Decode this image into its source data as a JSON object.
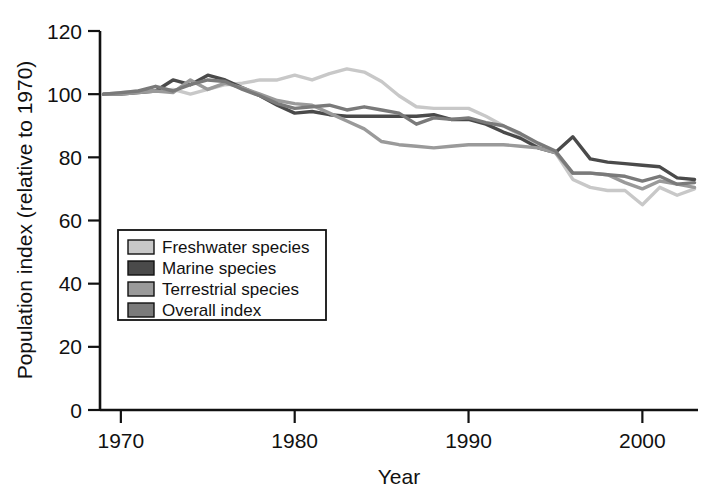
{
  "chart_data": {
    "type": "line",
    "title": "",
    "xlabel": "Year",
    "ylabel": "Population index (relative to 1970)",
    "xlim": [
      1968.8,
      2003.2
    ],
    "ylim": [
      0,
      120
    ],
    "xticks": [
      1970,
      1980,
      1990,
      2000
    ],
    "yticks": [
      0,
      20,
      40,
      60,
      80,
      100,
      120
    ],
    "grid": false,
    "legend_position": "inside-lower-left",
    "x": [
      1969,
      1970,
      1971,
      1972,
      1973,
      1974,
      1975,
      1976,
      1977,
      1978,
      1979,
      1980,
      1981,
      1982,
      1983,
      1984,
      1985,
      1986,
      1987,
      1988,
      1989,
      1990,
      1991,
      1992,
      1993,
      1994,
      1995,
      1996,
      1997,
      1998,
      1999,
      2000,
      2001,
      2002,
      2003
    ],
    "series": [
      {
        "name": "Freshwater species",
        "color": "#c8c8c8",
        "values": [
          100,
          100.5,
          101,
          101,
          101.5,
          100,
          101.5,
          103,
          103.5,
          104.5,
          104.5,
          106,
          104.5,
          106.5,
          108,
          107,
          104,
          99.5,
          96,
          95.5,
          95.5,
          95.5,
          93,
          90,
          87,
          84,
          81.5,
          73,
          70.5,
          69.5,
          69.5,
          65,
          70.5,
          68,
          70
        ]
      },
      {
        "name": "Marine species",
        "color": "#4a4a4a",
        "values": [
          100,
          100,
          100.5,
          101,
          104.5,
          103,
          106,
          104.5,
          102,
          99.5,
          96.5,
          94,
          94.5,
          93.5,
          93,
          93,
          93,
          93,
          93,
          93.5,
          92,
          92,
          90.5,
          88,
          86,
          83,
          81.5,
          86.5,
          79.5,
          78.5,
          78,
          77.5,
          77,
          73.5,
          73
        ]
      },
      {
        "name": "Terrestrial species",
        "color": "#9a9a9a",
        "values": [
          100,
          100,
          100.5,
          101,
          100.5,
          104.5,
          101.5,
          103.5,
          102,
          100,
          98,
          97,
          96.5,
          94,
          91.5,
          89,
          85,
          84,
          83.5,
          83,
          83.5,
          84,
          84,
          84,
          83.5,
          83,
          81.5,
          75,
          75,
          74.5,
          72,
          70,
          72.5,
          71.5,
          70.5
        ]
      },
      {
        "name": "Overall index",
        "color": "#7a7a7a",
        "values": [
          100,
          100.5,
          101,
          102.5,
          101,
          103,
          104.5,
          104,
          101.5,
          99.5,
          97,
          95.5,
          96,
          96.5,
          95,
          96,
          95,
          94,
          90.5,
          92.5,
          92,
          92.5,
          91,
          90,
          87.5,
          84.5,
          82,
          75,
          75,
          74.5,
          74,
          72.5,
          74,
          71.5,
          72
        ]
      }
    ]
  },
  "legend": {
    "items": [
      {
        "label": "Freshwater species",
        "swatch_color": "#c8c8c8"
      },
      {
        "label": "Marine species",
        "swatch_color": "#4a4a4a"
      },
      {
        "label": "Terrestrial species",
        "swatch_color": "#9a9a9a"
      },
      {
        "label": "Overall index",
        "swatch_color": "#7a7a7a"
      }
    ]
  },
  "axes": {
    "y_title": "Population index (relative to 1970)",
    "x_title": "Year",
    "y_tick_labels": [
      "0",
      "20",
      "40",
      "60",
      "80",
      "100",
      "120"
    ],
    "x_tick_labels": [
      "1970",
      "1980",
      "1990",
      "2000"
    ]
  }
}
